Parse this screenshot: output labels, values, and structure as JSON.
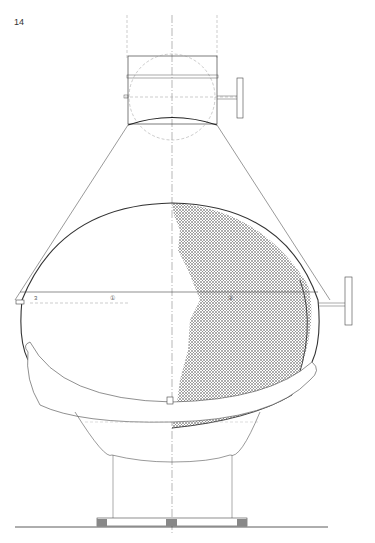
{
  "page": {
    "number": "14"
  },
  "drawing": {
    "subject": "suspended fireplace elevation",
    "markers": {
      "left_label": "3",
      "circle_label_1": "①",
      "circle_label_2": "②"
    },
    "colors": {
      "line": "#333333",
      "hatch": "#888888",
      "centerline": "#777777"
    }
  }
}
